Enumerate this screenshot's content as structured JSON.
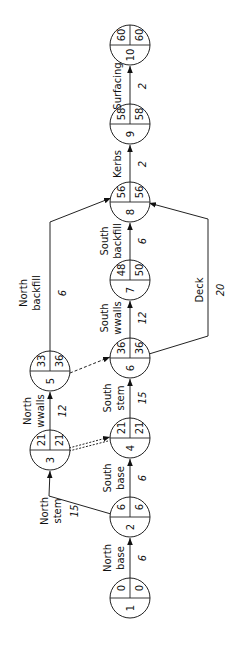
{
  "diagram": {
    "type": "activity-on-node network (critical path)",
    "orientation": "rotated 90° counter-clockwise",
    "nodes": [
      {
        "id": "1",
        "event": "1",
        "earliest": "0",
        "latest": "0",
        "cx": 130,
        "cy": 598
      },
      {
        "id": "2",
        "event": "2",
        "earliest": "6",
        "latest": "6",
        "cx": 130,
        "cy": 517
      },
      {
        "id": "3",
        "event": "3",
        "earliest": "21",
        "latest": "21",
        "cx": 50,
        "cy": 450
      },
      {
        "id": "4",
        "event": "4",
        "earliest": "21",
        "latest": "21",
        "cx": 130,
        "cy": 438
      },
      {
        "id": "5",
        "event": "5",
        "earliest": "33",
        "latest": "36",
        "cx": 50,
        "cy": 371
      },
      {
        "id": "6",
        "event": "6",
        "earliest": "36",
        "latest": "36",
        "cx": 130,
        "cy": 358
      },
      {
        "id": "7",
        "event": "7",
        "earliest": "48",
        "latest": "50",
        "cx": 130,
        "cy": 280
      },
      {
        "id": "8",
        "event": "8",
        "earliest": "56",
        "latest": "56",
        "cx": 130,
        "cy": 202
      },
      {
        "id": "9",
        "event": "9",
        "earliest": "58",
        "latest": "58",
        "cx": 130,
        "cy": 124
      },
      {
        "id": "10",
        "event": "10",
        "earliest": "60",
        "latest": "60",
        "cx": 130,
        "cy": 45
      }
    ],
    "activities": [
      {
        "from": "1",
        "to": "2",
        "label_line1": "North",
        "label_line2": "base",
        "duration": "6"
      },
      {
        "from": "2",
        "to": "3",
        "label_line1": "North",
        "label_line2": "stem",
        "duration": "15"
      },
      {
        "from": "2",
        "to": "4",
        "label_line1": "South",
        "label_line2": "base",
        "duration": "6"
      },
      {
        "from": "3",
        "to": "5",
        "label_line1": "North",
        "label_line2": "wwalls",
        "duration": "12"
      },
      {
        "from": "3",
        "to": "4",
        "label_line1": "",
        "label_line2": "",
        "duration": "",
        "style": "double-dashed dummy"
      },
      {
        "from": "4",
        "to": "6",
        "label_line1": "South",
        "label_line2": "stem",
        "duration": "15"
      },
      {
        "from": "5",
        "to": "6",
        "label_line1": "",
        "label_line2": "",
        "duration": "",
        "style": "dashed dummy"
      },
      {
        "from": "5",
        "to": "8",
        "label_line1": "North",
        "label_line2": "backfill",
        "duration": "6"
      },
      {
        "from": "6",
        "to": "7",
        "label_line1": "South",
        "label_line2": "wwalls",
        "duration": "12"
      },
      {
        "from": "6",
        "to": "8",
        "label_line1": "Deck",
        "label_line2": "",
        "duration": "20"
      },
      {
        "from": "7",
        "to": "8",
        "label_line1": "South",
        "label_line2": "backfill",
        "duration": "6"
      },
      {
        "from": "8",
        "to": "9",
        "label_line1": "Kerbs",
        "label_line2": "",
        "duration": "2"
      },
      {
        "from": "9",
        "to": "10",
        "label_line1": "Surfacing",
        "label_line2": "",
        "duration": "2"
      }
    ]
  },
  "colors": {
    "line": "#222222",
    "text": "#111111",
    "background": "#ffffff"
  }
}
